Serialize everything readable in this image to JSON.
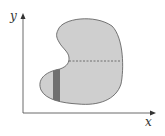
{
  "figure": {
    "x_axis_label": "x",
    "y_axis_label": "y",
    "colors": {
      "region_fill": "#cfcfcf",
      "region_stroke": "#555555",
      "strip_fill": "#707070",
      "axis": "#444444",
      "dashed_line": "#555555"
    },
    "elements": [
      "kidney-shaped region",
      "dashed horizontal chord",
      "dark vertical strip"
    ]
  }
}
